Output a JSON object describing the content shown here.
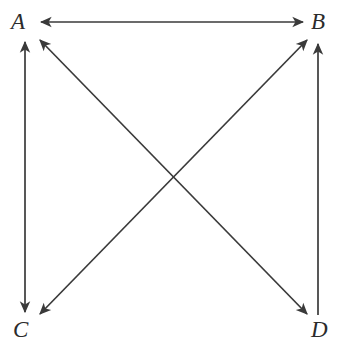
{
  "diagram": {
    "type": "directed-graph",
    "title": "",
    "background_color": "#ffffff",
    "stroke_color": "#3a3a3a",
    "label_color": "#2b2b2b",
    "nodes": [
      {
        "id": "A",
        "label": "A",
        "x": 25,
        "y": 25,
        "corner": "top-left"
      },
      {
        "id": "B",
        "label": "B",
        "x": 318,
        "y": 25,
        "corner": "top-right"
      },
      {
        "id": "C",
        "label": "C",
        "x": 25,
        "y": 328,
        "corner": "bottom-left"
      },
      {
        "id": "D",
        "label": "D",
        "x": 318,
        "y": 328,
        "corner": "bottom-right"
      }
    ],
    "edges": [
      {
        "id": "edge-ab",
        "from": "A",
        "to": "B",
        "direction": "bidirectional",
        "orientation": "horizontal",
        "arrowheads": [
          "A",
          "B"
        ]
      },
      {
        "id": "edge-ac",
        "from": "A",
        "to": "C",
        "direction": "bidirectional",
        "orientation": "vertical",
        "arrowheads": [
          "A",
          "C"
        ]
      },
      {
        "id": "edge-db",
        "from": "D",
        "to": "B",
        "direction": "unidirectional",
        "orientation": "vertical",
        "arrowheads": [
          "B"
        ]
      },
      {
        "id": "edge-ad",
        "from": "A",
        "to": "D",
        "direction": "bidirectional",
        "orientation": "diagonal",
        "arrowheads": [
          "A",
          "D"
        ]
      },
      {
        "id": "edge-cb",
        "from": "C",
        "to": "B",
        "direction": "bidirectional",
        "orientation": "diagonal",
        "arrowheads": [
          "C",
          "B"
        ]
      }
    ]
  }
}
